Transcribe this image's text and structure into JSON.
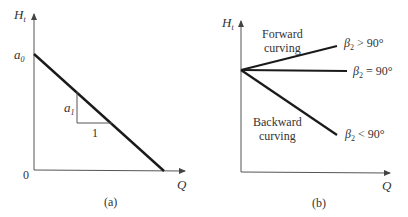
{
  "panel_a": {
    "caption": "(a)",
    "y_axis_label": "H",
    "y_axis_sub": "t",
    "x_axis_label": "Q",
    "origin_label": "0",
    "intercept_label": "a",
    "intercept_sub": "0",
    "slope_label": "a",
    "slope_sub": "1",
    "run_label": "1"
  },
  "panel_b": {
    "caption": "(b)",
    "y_axis_label": "H",
    "y_axis_sub": "t",
    "x_axis_label": "Q",
    "region_forward_line1": "Forward",
    "region_forward_line2": "curving",
    "region_backward_line1": "Backward",
    "region_backward_line2": "curving",
    "curves": [
      {
        "symbol": "β",
        "sub": "2",
        "relation": " > 90°"
      },
      {
        "symbol": "β",
        "sub": "2",
        "relation": " = 90°"
      },
      {
        "symbol": "β",
        "sub": "2",
        "relation": " < 90°"
      }
    ]
  },
  "colors": {
    "line": "#1a1a1a",
    "axis": "#555555",
    "text": "#333333"
  }
}
